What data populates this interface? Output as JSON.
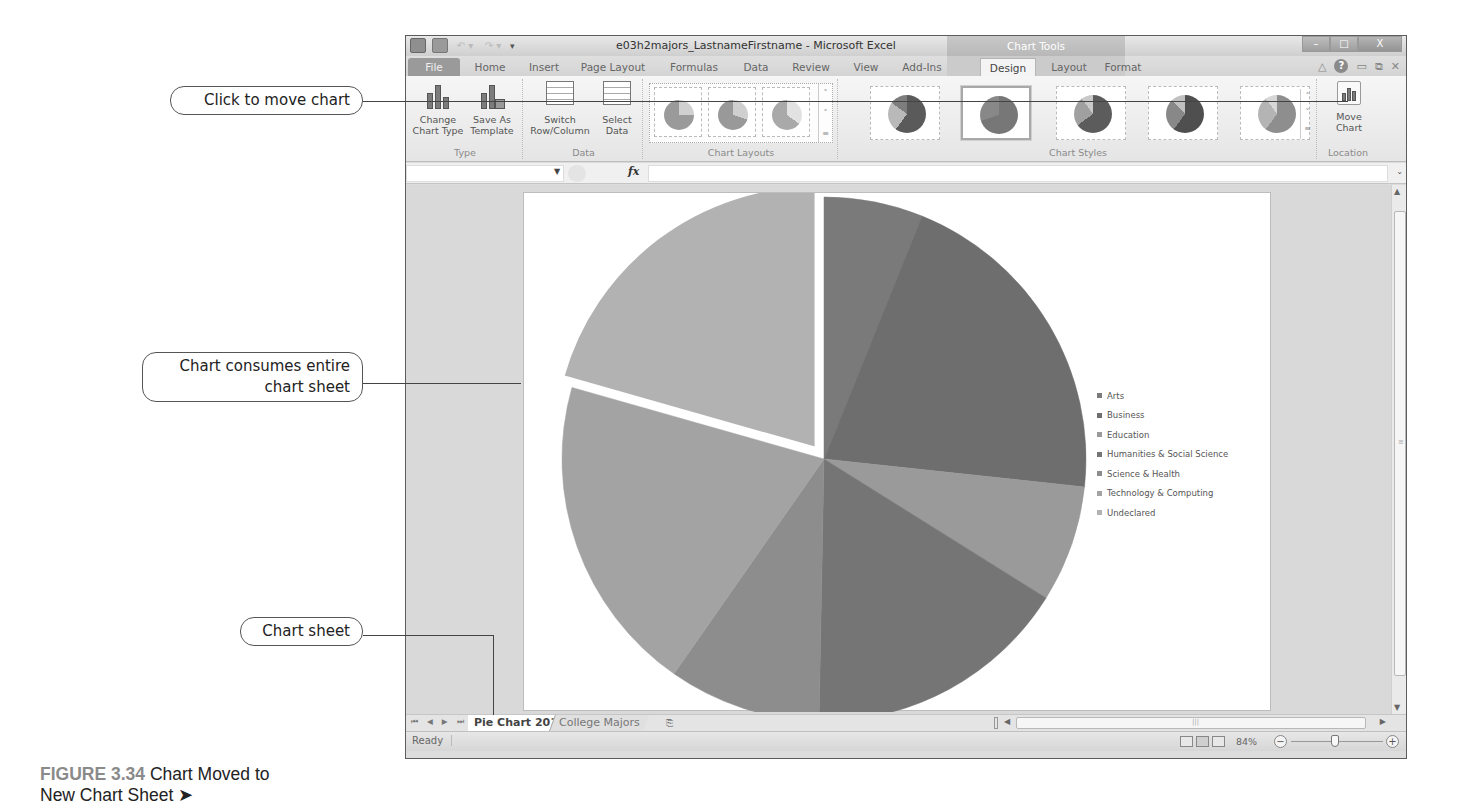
{
  "window": {
    "title": "e03h2majors_LastnameFirstname - Microsoft Excel",
    "contextual_tab_group": "Chart Tools",
    "controls": {
      "minimize": "–",
      "restore": "□",
      "close": "X"
    }
  },
  "ribbon_tabs": [
    {
      "label": "File"
    },
    {
      "label": "Home"
    },
    {
      "label": "Insert"
    },
    {
      "label": "Page Layout"
    },
    {
      "label": "Formulas"
    },
    {
      "label": "Data"
    },
    {
      "label": "Review"
    },
    {
      "label": "View"
    },
    {
      "label": "Add-Ins"
    },
    {
      "label": "Design",
      "active": true
    },
    {
      "label": "Layout"
    },
    {
      "label": "Format"
    }
  ],
  "ribbon": {
    "groups": {
      "type": {
        "label": "Type",
        "change_chart_type": "Change Chart Type",
        "change_chart_type_l1": "Change",
        "change_chart_type_l2": "Chart Type",
        "save_as_template_l1": "Save As",
        "save_as_template_l2": "Template"
      },
      "data": {
        "label": "Data",
        "switch_l1": "Switch",
        "switch_l2": "Row/Column",
        "select_l1": "Select",
        "select_l2": "Data"
      },
      "chart_layouts": {
        "label": "Chart Layouts",
        "item_count": 3
      },
      "chart_styles": {
        "label": "Chart Styles",
        "item_count": 5,
        "selected_index": 1
      },
      "location": {
        "label": "Location",
        "move_chart_l1": "Move",
        "move_chart_l2": "Chart"
      }
    }
  },
  "formula_bar": {
    "name_box": "",
    "fx_label": "fx",
    "formula": ""
  },
  "chart_data": {
    "type": "pie",
    "title": "",
    "categories": [
      "Arts",
      "Business",
      "Education",
      "Humanities & Social Science",
      "Science & Health",
      "Technology & Computing",
      "Undeclared"
    ],
    "values": [
      6.1,
      20.6,
      7.2,
      16.4,
      9.4,
      19.7,
      20.6
    ],
    "value_unit": "percent (estimated from slice angles)",
    "exploded": [
      "Undeclared"
    ],
    "start_angle_deg": 0,
    "legend_position": "right",
    "colors": [
      "#7a7a7a",
      "#6e6e6e",
      "#9a9a9a",
      "#757575",
      "#8d8d8d",
      "#a3a3a3",
      "#b2b2b2"
    ]
  },
  "legend": {
    "items": [
      {
        "label": "Arts",
        "color": "#7a7a7a"
      },
      {
        "label": "Business",
        "color": "#6e6e6e"
      },
      {
        "label": "Education",
        "color": "#9a9a9a"
      },
      {
        "label": "Humanities & Social Science",
        "color": "#757575"
      },
      {
        "label": "Science & Health",
        "color": "#8d8d8d"
      },
      {
        "label": "Technology & Computing",
        "color": "#a3a3a3"
      },
      {
        "label": "Undeclared",
        "color": "#b2b2b2"
      }
    ]
  },
  "sheet_tabs": {
    "nav": [
      "⏮",
      "◀",
      "▶",
      "⏭"
    ],
    "tabs": [
      {
        "label": "Pie Chart 2012",
        "active": true
      },
      {
        "label": "College Majors",
        "active": false
      }
    ],
    "insert_icon": "⎘"
  },
  "status_bar": {
    "ready": "Ready",
    "zoom_percent": "84%",
    "zoom_minus": "−",
    "zoom_plus": "+"
  },
  "callouts": {
    "move_chart": "Click to move chart",
    "consumes_l1": "Chart consumes entire",
    "consumes_l2": "chart sheet",
    "chart_sheet": "Chart sheet"
  },
  "caption": {
    "figure_number": "FIGURE 3.34",
    "text_l1": " Chart Moved to",
    "text_l2": "New Chart Sheet ➤"
  }
}
